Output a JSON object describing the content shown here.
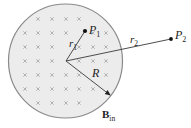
{
  "diagram": {
    "region": {
      "fill_color": "#ececec",
      "border_color": "#8a8a8a",
      "field_symbol": "×",
      "field_direction": "into page"
    },
    "labels": {
      "p1": "P",
      "p1_sub": "1",
      "p2": "P",
      "p2_sub": "2",
      "r1": "r",
      "r1_sub": "1",
      "r2": "r",
      "r2_sub": "2",
      "R": "R",
      "B": "B",
      "B_sub": "in"
    },
    "colors": {
      "line": "#3a3a3a",
      "point": "#111111"
    }
  }
}
